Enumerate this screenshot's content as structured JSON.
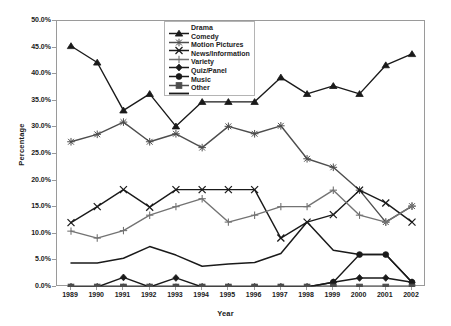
{
  "chart_data": {
    "type": "line",
    "title": "",
    "xlabel": "Year",
    "ylabel": "Percentage",
    "categories": [
      "1989",
      "1990",
      "1991",
      "1992",
      "1993",
      "1994",
      "1995",
      "1996",
      "1997",
      "1998",
      "1999",
      "2000",
      "2001",
      "2002"
    ],
    "x": [
      1989,
      1990,
      1991,
      1992,
      1993,
      1994,
      1995,
      1996,
      1997,
      1998,
      1999,
      2000,
      2001,
      2002
    ],
    "ylim": [
      0,
      50
    ],
    "yticks": [
      0,
      5,
      10,
      15,
      20,
      25,
      30,
      35,
      40,
      45,
      50
    ],
    "ytick_labels": [
      "0.0%",
      "5.0%",
      "10.0%",
      "15.0%",
      "20.0%",
      "25.0%",
      "30.0%",
      "35.0%",
      "40.0%",
      "45.0%",
      "50.0%"
    ],
    "grid": false,
    "legend_position": "top-center-inside",
    "value_unit": "percent",
    "series": [
      {
        "name": "Drama",
        "marker": "triangle",
        "color": "#1a1a1a",
        "values": [
          45.3,
          42.2,
          33.2,
          36.3,
          30.2,
          34.8,
          34.8,
          34.8,
          39.4,
          36.3,
          37.8,
          36.3,
          41.7,
          43.8
        ]
      },
      {
        "name": "Comedy",
        "marker": "asterisk",
        "color": "#4d4d4d",
        "values": [
          27.3,
          28.7,
          31.0,
          27.3,
          28.8,
          26.2,
          30.2,
          28.8,
          30.3,
          24.1,
          22.5,
          18.2,
          12.2,
          15.2
        ]
      },
      {
        "name": "Motion Pictures",
        "marker": "x",
        "color": "#1a1a1a",
        "values": [
          12.1,
          15.1,
          18.3,
          15.0,
          18.3,
          18.3,
          18.3,
          18.3,
          9.2,
          12.2,
          13.6,
          18.2,
          15.8,
          12.2
        ]
      },
      {
        "name": "News/Information",
        "marker": "plus",
        "color": "#737373",
        "values": [
          10.5,
          9.2,
          10.6,
          13.5,
          15.1,
          16.6,
          12.2,
          13.5,
          15.1,
          15.1,
          18.2,
          13.5,
          12.2,
          15.2
        ]
      },
      {
        "name": "Variety",
        "marker": "diamond",
        "color": "#1a1a1a",
        "values": [
          0.0,
          0.0,
          1.8,
          0.0,
          1.7,
          0.0,
          0.0,
          0.0,
          0.0,
          0.0,
          0.9,
          1.7,
          1.7,
          0.9
        ]
      },
      {
        "name": "Quiz/Panel",
        "marker": "circle",
        "color": "#1a1a1a",
        "values": [
          0.0,
          0.0,
          0.0,
          0.0,
          0.0,
          0.0,
          0.0,
          0.0,
          0.0,
          0.0,
          0.9,
          6.1,
          6.1,
          0.9
        ]
      },
      {
        "name": "Music",
        "marker": "square",
        "color": "#4d4d4d",
        "values": [
          0.0,
          0.0,
          0.0,
          0.0,
          0.0,
          0.0,
          0.0,
          0.0,
          0.0,
          0.0,
          0.0,
          0.0,
          0.0,
          0.0
        ]
      },
      {
        "name": "Other",
        "marker": "none",
        "color": "#1a1a1a",
        "values": [
          4.5,
          4.5,
          5.4,
          7.6,
          6.0,
          3.9,
          4.3,
          4.6,
          6.3,
          12.2,
          6.9,
          6.1,
          6.1,
          0.9
        ]
      }
    ]
  },
  "axes": {
    "ylabel": "Percentage",
    "xlabel": "Year"
  },
  "legend": {
    "items": [
      {
        "label": "Drama"
      },
      {
        "label": "Comedy"
      },
      {
        "label": "Motion Pictures"
      },
      {
        "label": "News/Information"
      },
      {
        "label": "Variety"
      },
      {
        "label": "Quiz/Panel"
      },
      {
        "label": "Music"
      },
      {
        "label": "Other"
      }
    ]
  }
}
